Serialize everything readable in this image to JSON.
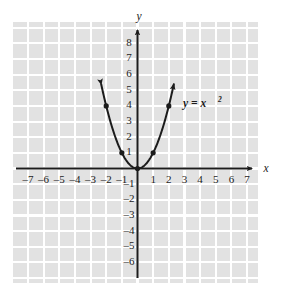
{
  "chart_data": {
    "type": "line",
    "title": "",
    "subtitle": "",
    "xlabel": "x",
    "ylabel": "y",
    "equation_label": "y = x",
    "equation_exponent": "2",
    "xlim": [
      -8,
      8
    ],
    "ylim": [
      -7,
      9
    ],
    "grid": true,
    "grid_step": 1,
    "legend_position": "inline-right",
    "x_tick_labels": [
      "–7",
      "–6",
      "–5",
      "–4",
      "–3",
      "–2",
      "–1",
      "1",
      "2",
      "3",
      "4",
      "5",
      "6",
      "7"
    ],
    "x_tick_values": [
      -7,
      -6,
      -5,
      -4,
      -3,
      -2,
      -1,
      1,
      2,
      3,
      4,
      5,
      6,
      7
    ],
    "y_tick_labels": [
      "8",
      "7",
      "6",
      "5",
      "4",
      "3",
      "2",
      "1",
      "–1",
      "–2",
      "–3",
      "–4",
      "–5",
      "–6"
    ],
    "y_tick_values": [
      8,
      7,
      6,
      5,
      4,
      3,
      2,
      1,
      -1,
      -2,
      -3,
      -4,
      -5,
      -6
    ],
    "series": [
      {
        "name": "y = x^2",
        "function": "x^2",
        "marked_points": [
          {
            "x": -2,
            "y": 4
          },
          {
            "x": -1,
            "y": 1
          },
          {
            "x": 0,
            "y": 0
          },
          {
            "x": 1,
            "y": 1
          },
          {
            "x": 2,
            "y": 4
          }
        ],
        "curve_x_range": [
          -2.32,
          2.32
        ],
        "arrow_ends": [
          "left-up",
          "right-up"
        ]
      }
    ],
    "colors": {
      "grid_cell": "#e2e2e2",
      "grid_line": "#ffffff",
      "axis": "#1c1c1c",
      "curve": "#1c1c1c",
      "point": "#1c1c1c",
      "text": "#1c1c1c",
      "background": "#ffffff"
    }
  }
}
